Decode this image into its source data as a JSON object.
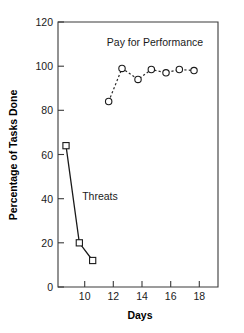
{
  "chart_data": {
    "type": "line",
    "title": "",
    "xlabel": "Days",
    "ylabel": "Percentage of Tasks Done",
    "xlim": [
      8,
      20
    ],
    "ylim": [
      0,
      120
    ],
    "xticks": [
      10,
      12,
      14,
      16,
      18
    ],
    "xtick_labels": [
      "10",
      "12",
      "14",
      "16",
      "18"
    ],
    "yticks": [
      0,
      20,
      40,
      60,
      80,
      100,
      120
    ],
    "ytick_labels": [
      "0",
      "20",
      "40",
      "60",
      "80",
      "100",
      "120"
    ],
    "grid": false,
    "legend": "annotations-inline",
    "series": [
      {
        "name": "Threats",
        "marker": "square",
        "linestyle": "solid",
        "color": "#1a1a1a",
        "annotation": "Threats",
        "x": [
          8.6,
          9.6,
          10.6
        ],
        "y": [
          64,
          20,
          12
        ]
      },
      {
        "name": "Pay for Performance",
        "marker": "circle",
        "linestyle": "dashed",
        "color": "#2a2a2a",
        "annotation": "Pay for Performance",
        "x": [
          11.8,
          12.8,
          14.0,
          15.0,
          16.1,
          17.1,
          18.2
        ],
        "y": [
          84,
          99,
          94,
          98.5,
          97,
          98.5,
          98
        ]
      }
    ],
    "annotations": [
      {
        "text": "Pay for Performance",
        "x": 14.8,
        "y": 110
      },
      {
        "text": "Threats",
        "x": 11.0,
        "y": 42
      }
    ]
  },
  "axes": {
    "x_axis_label": "Days",
    "y_axis_label": "Percentage of Tasks Done"
  }
}
